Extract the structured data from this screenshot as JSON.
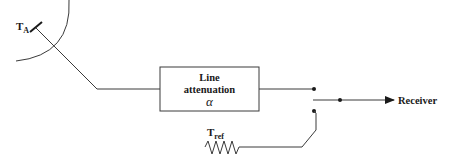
{
  "diagram": {
    "antenna": {
      "label_main": "T",
      "label_sub": "A"
    },
    "attenuator": {
      "line1": "Line",
      "line2": "attenuation",
      "symbol": "α"
    },
    "reference": {
      "label_main": "T",
      "label_sub": "ref"
    },
    "output": {
      "label": "Receiver"
    },
    "colors": {
      "stroke": "#3a3a3a",
      "text": "#1a1a1a",
      "background": "#ffffff"
    }
  }
}
